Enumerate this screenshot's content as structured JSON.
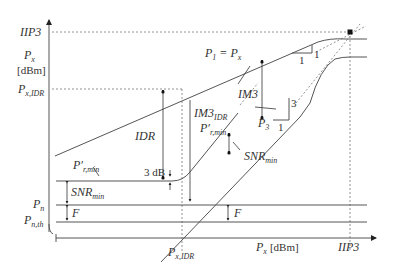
{
  "diagram": {
    "type": "receiver-dynamic-range",
    "y_axis": {
      "labels": {
        "iip3": "IIP3",
        "px": "P",
        "px_sub": "x",
        "unit": "[dBm]",
        "px_idr": "P",
        "px_idr_sub": "x,IDR",
        "pn": "P",
        "pn_sub": "n",
        "pnth": "P",
        "pnth_sub": "n,th"
      }
    },
    "x_axis": {
      "labels": {
        "px_idr": "P",
        "px_idr_sub": "x,IDR",
        "px": "P",
        "px_sub": "x",
        "unit": "[dBm]",
        "iip3": "IIP3"
      }
    },
    "annotations": {
      "p1_eq_px": "P",
      "p1_sub": "1",
      "eq": " = P",
      "eq_sub": "x",
      "im3": "IM3",
      "im3_idr": "IM3",
      "im3_idr_sub": "IDR",
      "idr": "IDR",
      "p3": "P",
      "p3_sub": "3",
      "prmin_top": "P′",
      "prmin_top_sub": "r,min",
      "prmin_left": "P′",
      "prmin_left_sub": "r,min",
      "snr_min_mid": "SNR",
      "snr_min_mid_sub": "min",
      "snr_min_left": "SNR",
      "snr_min_left_sub": "min",
      "three_db": "3 dB",
      "f_left": "F",
      "f_right": "F",
      "slope1_run": "1",
      "slope1_rise": "1",
      "slope3_run": "1",
      "slope3_rise": "3"
    }
  }
}
